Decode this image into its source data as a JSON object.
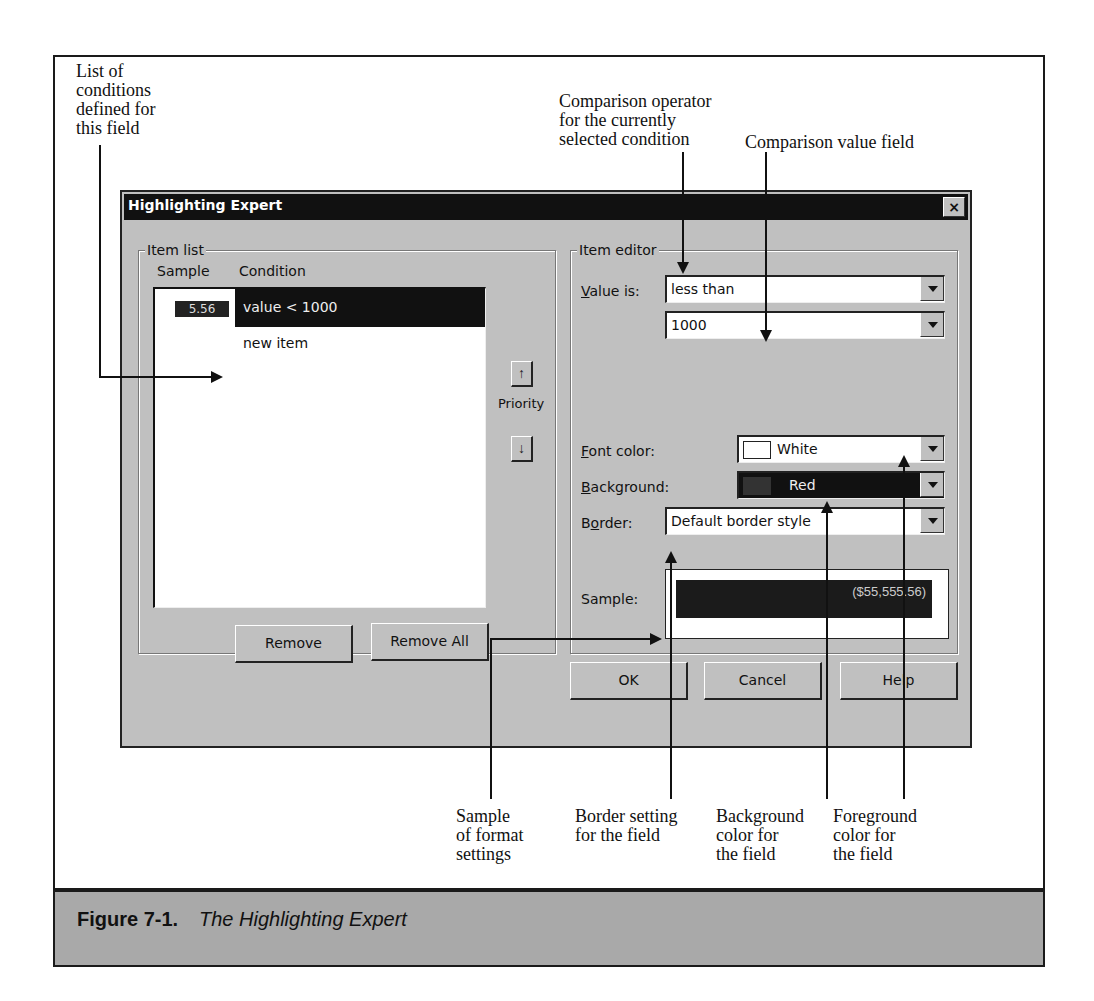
{
  "figure": {
    "number": "Figure 7-1.",
    "title": "The Highlighting Expert"
  },
  "callouts": {
    "list_of_conditions": "List of\nconditions\ndefined for\nthis field",
    "comparison_operator": "Comparison operator\nfor the currently\nselected condition",
    "comparison_value": "Comparison value field",
    "sample_format": "Sample\nof format\nsettings",
    "border_setting": "Border setting\nfor the field",
    "background_color": "Background\ncolor for\nthe field",
    "foreground_color": "Foreground\ncolor for\nthe field"
  },
  "dialog": {
    "title": "Highlighting Expert",
    "close_label": "×",
    "item_list": {
      "group_label": "Item list",
      "col_sample": "Sample",
      "col_condition": "Condition",
      "items": [
        {
          "sample": "5.56",
          "condition": "value < 1000",
          "selected": true
        },
        {
          "sample": "",
          "condition": "new item",
          "selected": false
        }
      ],
      "priority_label": "Priority",
      "priority_up": "↑",
      "priority_down": "↓",
      "remove_label": "Remove",
      "remove_all_label": "Remove All"
    },
    "item_editor": {
      "group_label": "Item editor",
      "value_is_label_prefix": "",
      "value_is_label_ul": "V",
      "value_is_label_rest": "alue is:",
      "operator_value": "less than",
      "comparison_value": "1000",
      "font_color_label_ul": "F",
      "font_color_label_rest": "ont color:",
      "font_color_value": "White",
      "font_color_swatch": "#ffffff",
      "background_label_ul": "B",
      "background_label_rest": "ackground:",
      "background_value": "Red",
      "background_swatch": "#333333",
      "border_label_pre": "B",
      "border_label_ul": "o",
      "border_label_rest": "rder:",
      "border_value": "Default border style",
      "sample_label": "Sample:",
      "sample_value": "($55,555.56)"
    },
    "buttons": {
      "ok": "OK",
      "cancel": "Cancel",
      "help": "Help"
    }
  }
}
